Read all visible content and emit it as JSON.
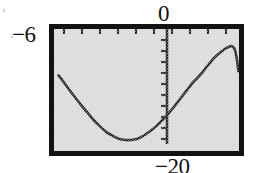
{
  "figure": {
    "kind": "graphing-calculator-viewing-window",
    "labels": {
      "xmin": "−6",
      "ymax": "0",
      "ymin": "−20",
      "xmax": "⌐"
    },
    "frame": {
      "border_color": "#121212",
      "screen_fill": "#d8d8d8",
      "curve_color": "#1a1a1a"
    }
  },
  "chart_data": {
    "type": "line",
    "title": "",
    "xlabel": "",
    "ylabel": "",
    "xlim": [
      -6,
      0
    ],
    "ylim": [
      -20,
      0
    ],
    "grid": false,
    "legend": null,
    "axes": {
      "vertical_axis_at_x": -1.35,
      "horizontal_axis": "top-border",
      "x_tick_count": 10,
      "y_tick_count": 10,
      "tick_side": "inside"
    },
    "annotations": [
      {
        "text": "−6",
        "position": "left-of-window",
        "meaning": "Xmin"
      },
      {
        "text": "0",
        "position": "above-window",
        "meaning": "Ymax"
      },
      {
        "text": "−20",
        "position": "below-window",
        "meaning": "Ymin"
      }
    ],
    "series": [
      {
        "name": "curve",
        "comment": "sinusoid-like curve: enters upper-left, dips to a minimum, rises through the vertical axis, peaks, then falls steeply at the right",
        "x": [
          -5.85,
          -5.7,
          -5.5,
          -5.3,
          -5.1,
          -4.9,
          -4.7,
          -4.5,
          -4.3,
          -4.1,
          -3.9,
          -3.7,
          -3.5,
          -3.3,
          -3.1,
          -2.9,
          -2.7,
          -2.5,
          -2.3,
          -2.1,
          -1.9,
          -1.7,
          -1.5,
          -1.35,
          -1.2,
          -1.0,
          -0.8,
          -0.6,
          -0.4,
          -0.25,
          -0.15,
          -0.08,
          -0.02
        ],
        "y": [
          -7.6,
          -8.6,
          -10.0,
          -11.3,
          -12.6,
          -13.8,
          -15.0,
          -16.0,
          -16.9,
          -17.5,
          -18.0,
          -18.2,
          -18.2,
          -18.0,
          -17.5,
          -16.8,
          -16.0,
          -15.0,
          -13.9,
          -12.7,
          -11.4,
          -10.1,
          -8.8,
          -8.0,
          -7.2,
          -5.9,
          -4.7,
          -3.8,
          -3.1,
          -2.8,
          -3.2,
          -4.6,
          -6.9
        ]
      }
    ]
  }
}
